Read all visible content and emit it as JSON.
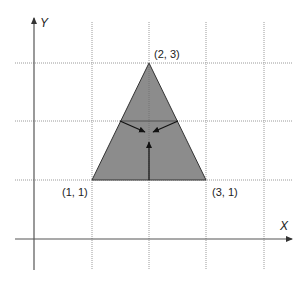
{
  "diagram": {
    "type": "coordinate-plane-triangle",
    "axes": {
      "x_label": "X",
      "y_label": "Y"
    },
    "vertices": [
      {
        "label": "(2, 3)",
        "x": 2,
        "y": 3
      },
      {
        "label": "(1, 1)",
        "x": 1,
        "y": 1
      },
      {
        "label": "(3, 1)",
        "x": 3,
        "y": 1
      }
    ],
    "grid": {
      "x_lines": [
        1,
        2,
        3,
        4
      ],
      "y_lines": [
        1,
        2,
        3
      ],
      "style": "dotted"
    },
    "colors": {
      "triangle_fill": "#8c8c8c",
      "triangle_stroke": "#333333",
      "axis": "#555555",
      "grid": "#999999",
      "arrow": "#111111",
      "background": "#ffffff"
    },
    "inner_arrows": [
      {
        "name": "left-edge-normal-arrow",
        "from": "left-edge-midpoint",
        "to": "center"
      },
      {
        "name": "right-edge-normal-arrow",
        "from": "right-edge-midpoint",
        "to": "center"
      },
      {
        "name": "base-normal-arrow",
        "from": "base-midpoint",
        "to": "center"
      }
    ]
  }
}
